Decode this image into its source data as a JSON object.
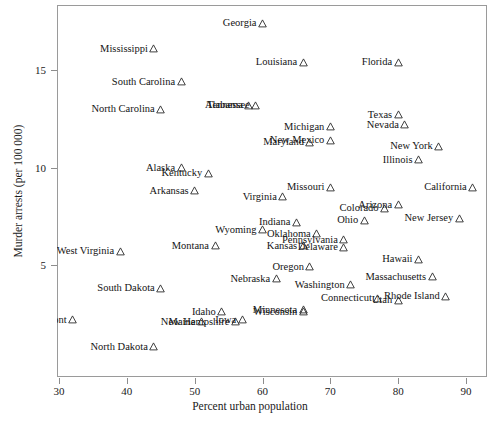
{
  "chart_data": {
    "type": "scatter",
    "title": "",
    "xlabel": "Percent urban population",
    "ylabel": "Murder arrests (per 100 000)",
    "xlim": [
      28.5,
      92.5
    ],
    "ylim": [
      0.2,
      18.4
    ],
    "xticks": [
      30,
      40,
      50,
      60,
      70,
      80,
      90
    ],
    "yticks": [
      5,
      10,
      15
    ],
    "grid": false,
    "legend": null,
    "marker": "open-triangle",
    "points": [
      {
        "label": "Georgia",
        "x": 60,
        "y": 17.4,
        "anchor": "right"
      },
      {
        "label": "Mississippi",
        "x": 44,
        "y": 16.1,
        "anchor": "right"
      },
      {
        "label": "Louisiana",
        "x": 66,
        "y": 15.4,
        "anchor": "right"
      },
      {
        "label": "Florida",
        "x": 80,
        "y": 15.4,
        "anchor": "right"
      },
      {
        "label": "South Carolina",
        "x": 48,
        "y": 14.4,
        "anchor": "right"
      },
      {
        "label": "Alabama",
        "x": 58,
        "y": 13.2,
        "anchor": "right"
      },
      {
        "label": "Tennessee",
        "x": 59,
        "y": 13.2,
        "anchor": "right"
      },
      {
        "label": "North Carolina",
        "x": 45,
        "y": 13.0,
        "anchor": "right"
      },
      {
        "label": "Texas",
        "x": 80,
        "y": 12.7,
        "anchor": "right"
      },
      {
        "label": "Nevada",
        "x": 81,
        "y": 12.2,
        "anchor": "right"
      },
      {
        "label": "Michigan",
        "x": 70,
        "y": 12.1,
        "anchor": "right"
      },
      {
        "label": "New Mexico",
        "x": 70,
        "y": 11.4,
        "anchor": "right"
      },
      {
        "label": "Maryland",
        "x": 67,
        "y": 11.3,
        "anchor": "right"
      },
      {
        "label": "New York",
        "x": 86,
        "y": 11.1,
        "anchor": "right"
      },
      {
        "label": "Illinois",
        "x": 83,
        "y": 10.4,
        "anchor": "right"
      },
      {
        "label": "Alaska",
        "x": 48,
        "y": 10.0,
        "anchor": "right"
      },
      {
        "label": "Kentucky",
        "x": 52,
        "y": 9.7,
        "anchor": "right"
      },
      {
        "label": "Missouri",
        "x": 70,
        "y": 9.0,
        "anchor": "right"
      },
      {
        "label": "California",
        "x": 91,
        "y": 9.0,
        "anchor": "right"
      },
      {
        "label": "Arkansas",
        "x": 50,
        "y": 8.8,
        "anchor": "right"
      },
      {
        "label": "Virginia",
        "x": 63,
        "y": 8.5,
        "anchor": "right"
      },
      {
        "label": "Arizona",
        "x": 80,
        "y": 8.1,
        "anchor": "right"
      },
      {
        "label": "Colorado",
        "x": 78,
        "y": 7.9,
        "anchor": "right"
      },
      {
        "label": "New Jersey",
        "x": 89,
        "y": 7.4,
        "anchor": "right"
      },
      {
        "label": "Ohio",
        "x": 75,
        "y": 7.3,
        "anchor": "right"
      },
      {
        "label": "Indiana",
        "x": 65,
        "y": 7.2,
        "anchor": "right"
      },
      {
        "label": "Wyoming",
        "x": 60,
        "y": 6.8,
        "anchor": "right"
      },
      {
        "label": "Oklahoma",
        "x": 68,
        "y": 6.6,
        "anchor": "right"
      },
      {
        "label": "Pennsylvania",
        "x": 72,
        "y": 6.3,
        "anchor": "right"
      },
      {
        "label": "Kansas",
        "x": 66,
        "y": 6.0,
        "anchor": "right"
      },
      {
        "label": "Delaware",
        "x": 72,
        "y": 5.9,
        "anchor": "right"
      },
      {
        "label": "Hawaii",
        "x": 83,
        "y": 5.3,
        "anchor": "right"
      },
      {
        "label": "West Virginia",
        "x": 39,
        "y": 5.7,
        "anchor": "right"
      },
      {
        "label": "Montana",
        "x": 53,
        "y": 6.0,
        "anchor": "right"
      },
      {
        "label": "Oregon",
        "x": 67,
        "y": 4.9,
        "anchor": "right"
      },
      {
        "label": "Massachusetts",
        "x": 85,
        "y": 4.4,
        "anchor": "right"
      },
      {
        "label": "Nebraska",
        "x": 62,
        "y": 4.3,
        "anchor": "right"
      },
      {
        "label": "South Dakota",
        "x": 45,
        "y": 3.8,
        "anchor": "right"
      },
      {
        "label": "Washington",
        "x": 73,
        "y": 4.0,
        "anchor": "right"
      },
      {
        "label": "Connecticut",
        "x": 77,
        "y": 3.3,
        "anchor": "right"
      },
      {
        "label": "Utah",
        "x": 80,
        "y": 3.2,
        "anchor": "right"
      },
      {
        "label": "Rhode Island",
        "x": 87,
        "y": 3.4,
        "anchor": "right"
      },
      {
        "label": "Idaho",
        "x": 54,
        "y": 2.6,
        "anchor": "right"
      },
      {
        "label": "Minnesota",
        "x": 66,
        "y": 2.7,
        "anchor": "right"
      },
      {
        "label": "Wisconsin",
        "x": 66,
        "y": 2.6,
        "anchor": "right"
      },
      {
        "label": "Vermont",
        "x": 32,
        "y": 2.2,
        "anchor": "right"
      },
      {
        "label": "Maine",
        "x": 51,
        "y": 2.1,
        "anchor": "right"
      },
      {
        "label": "New Hampshire",
        "x": 56,
        "y": 2.1,
        "anchor": "right"
      },
      {
        "label": "Iowa",
        "x": 57,
        "y": 2.2,
        "anchor": "right"
      },
      {
        "label": "North Dakota",
        "x": 44,
        "y": 0.8,
        "anchor": "right"
      }
    ]
  }
}
